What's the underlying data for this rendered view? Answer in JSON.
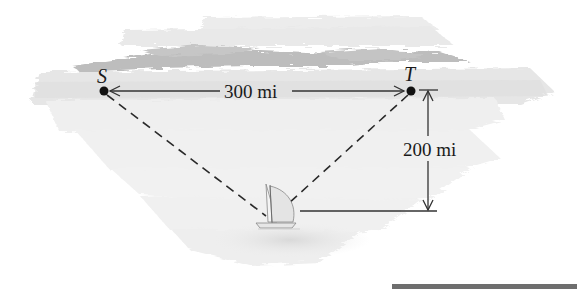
{
  "diagram": {
    "type": "geometry-word-problem",
    "points": [
      {
        "id": "S",
        "label": "S",
        "x": 104,
        "y": 91
      },
      {
        "id": "T",
        "label": "T",
        "x": 411,
        "y": 91
      },
      {
        "id": "boat",
        "label": "",
        "x": 272,
        "y": 222
      }
    ],
    "dimensions": {
      "horizontal": {
        "label": "300 mi",
        "from": "S",
        "to": "T"
      },
      "vertical": {
        "label": "200 mi",
        "from": "T-level",
        "to": "boat-level"
      }
    },
    "segments": [
      {
        "from": "S",
        "to": "boat",
        "style": "dashed"
      },
      {
        "from": "T",
        "to": "boat",
        "style": "dashed"
      }
    ],
    "illustration": "sailboat on sea with distant shoreline",
    "colors": {
      "ink": "#1a1a1a",
      "sea_light": "#efefef",
      "sea_mid": "#e2e2e2",
      "land": "#bdbdbd",
      "bar": "#6e6e6e"
    }
  }
}
